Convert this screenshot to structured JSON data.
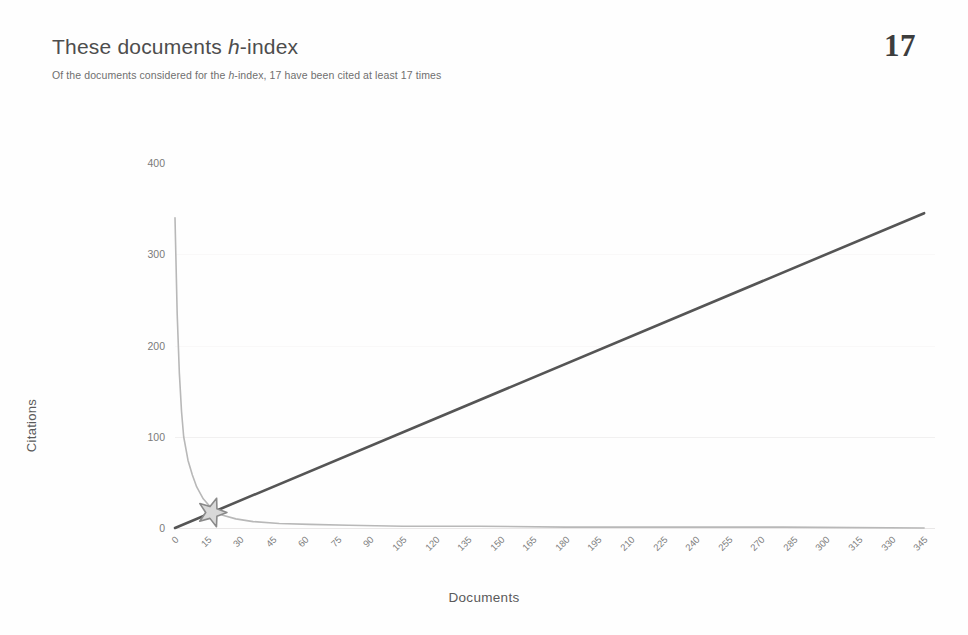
{
  "header": {
    "title_pre": "These documents ",
    "title_italic": "h",
    "title_post": "-index",
    "metric_value": "17",
    "subtitle_pre": "Of the documents considered for the ",
    "subtitle_italic": "h",
    "subtitle_post": "-index, 17 have been cited at least 17 times"
  },
  "chart_data": {
    "type": "line",
    "title": "These documents h-index",
    "xlabel": "Documents",
    "ylabel": "Citations",
    "xlim": [
      0,
      350
    ],
    "ylim": [
      0,
      400
    ],
    "grid": true,
    "legend": false,
    "xticks": [
      "0",
      "15",
      "30",
      "45",
      "60",
      "75",
      "90",
      "105",
      "120",
      "135",
      "150",
      "165",
      "180",
      "195",
      "210",
      "225",
      "240",
      "255",
      "270",
      "285",
      "300",
      "315",
      "330",
      "345"
    ],
    "yticks": [
      "0",
      "100",
      "200",
      "300",
      "400"
    ],
    "annotation": {
      "label": "h-index intersection",
      "x": 17,
      "y": 17,
      "marker": "star"
    },
    "series": [
      {
        "name": "Citations per document (sorted descending)",
        "x": [
          0,
          1,
          2,
          3,
          4,
          6,
          8,
          10,
          13,
          17,
          22,
          28,
          36,
          48,
          62,
          80,
          105,
          140,
          180,
          225,
          280,
          345
        ],
        "values": [
          340,
          235,
          170,
          128,
          100,
          74,
          58,
          45,
          32,
          21,
          14,
          10,
          7,
          5,
          4,
          3,
          2,
          2,
          1,
          1,
          1,
          0
        ]
      },
      {
        "name": "y = x reference line",
        "x": [
          0,
          345
        ],
        "values": [
          0,
          345
        ]
      }
    ]
  }
}
